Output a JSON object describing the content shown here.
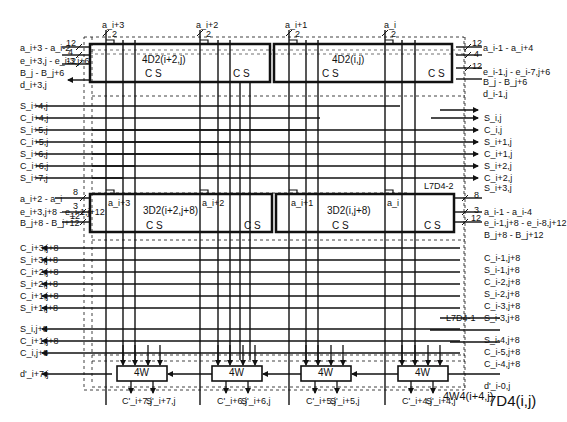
{
  "title": "7D4(i,j)",
  "blocks": {
    "top_left": "4D2(i+2,j)",
    "top_right": "4D2(i,j)",
    "mid_left": "3D2(i+2,j+8)",
    "mid_right": "3D2(i,j+8)",
    "cs": "C S",
    "w4": "4W",
    "w4_group": "4W4(i+4,j)",
    "layer2": "L7D4-2",
    "layer1": "L7D4-1"
  },
  "top_inputs": {
    "a_labels": [
      "a_i+3",
      "a_i+2",
      "a_i+1",
      "a_i"
    ],
    "width": "2"
  },
  "left_top_inputs": [
    {
      "label": "a_i+3 - a_i-2",
      "width": "12"
    },
    {
      "label": "e_i+3,j - e_i-3,j+6",
      "width": "4"
    },
    {
      "label": "B_j - B_j+6",
      "width": "12"
    },
    {
      "label": "d_i+3,j",
      "width": ""
    }
  ],
  "right_top_inputs": [
    {
      "label": "a_i-1 - a_i+4",
      "width": "12"
    },
    {
      "label": "e_i-1,j - e_i-7,j+6",
      "width": "4"
    },
    {
      "label": "B_j - B_j+6",
      "width": "12"
    },
    {
      "label": "d_i-1,j",
      "width": ""
    }
  ],
  "left_mid_signals": [
    "S_i+4,j",
    "C_i+4,j",
    "S_i+5,j",
    "C_i+5,j",
    "S_i+6,j",
    "C_i+6,j",
    "S_i+7,j"
  ],
  "right_mid_signals": [
    "S_i,j",
    "C_i,j",
    "S_i+1,j",
    "C_i+1,j",
    "S_i+2,j",
    "C_i+2,j",
    "S_i+3,j"
  ],
  "left_bottom_inputs": [
    {
      "label": "a_i+2 - a_i",
      "width": "8"
    },
    {
      "label": "e_i+3,j+8 - e_i-1,j+12",
      "width": "3"
    },
    {
      "label": "B_j+8 - B_j+12",
      "width": "12"
    }
  ],
  "right_bottom_inputs": [
    {
      "label": "a_i-1 - a_i-4",
      "width": "8"
    },
    {
      "label": "e_i-1,j+8 - e_i-8,j+12",
      "width": "3"
    },
    {
      "label": "B_j+8 - B_j+12",
      "width": "12"
    }
  ],
  "mid_a_labels": [
    "a_i+3",
    "a_i+2",
    "a_i+1",
    "a_i"
  ],
  "left_low_signals": [
    "C_i+3,j+8",
    "S_i+3,j+8",
    "C_i+2,j+8",
    "S_i+2,j+8",
    "C_i+1,j+8",
    "S_i+1,j+8",
    "S_i,j+8",
    "C_i+1,j+8",
    "C_i,j+8"
  ],
  "right_low_signals": [
    "C_i-1,j+8",
    "S_i-1,j+8",
    "C_i-2,j+8",
    "S_i-2,j+8",
    "C_i-3,j+8",
    "S_i-3,j+8",
    "S_i-4,j+8",
    "C_i-5,j+8",
    "C_i-4,j+8"
  ],
  "d_out_left": "d'_i+7,j",
  "d_in_right": "d'_i-0,j",
  "outputs": [
    {
      "c": "C'_i+7,j",
      "s": "S'_i+7,j"
    },
    {
      "c": "C'_i+6,j",
      "s": "S'_i+6,j"
    },
    {
      "c": "C'_i+5,j",
      "s": "S'_i+5,j"
    },
    {
      "c": "C'_i+4,j",
      "s": "S'_i+4,j"
    }
  ]
}
